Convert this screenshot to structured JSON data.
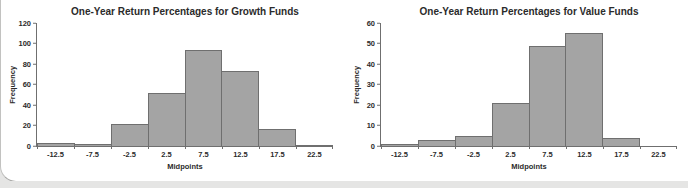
{
  "chart_data": [
    {
      "type": "bar",
      "title": "One-Year Return Percentages for Growth Funds",
      "xlabel": "Midpoints",
      "ylabel": "Frequency",
      "categories": [
        "-12.5",
        "-7.5",
        "-2.5",
        "2.5",
        "7.5",
        "12.5",
        "17.5",
        "22.5"
      ],
      "values": [
        3,
        2,
        21,
        52,
        94,
        73,
        17,
        1
      ],
      "ylim": [
        0,
        120
      ],
      "yticks": [
        0,
        20,
        40,
        60,
        80,
        100,
        120
      ],
      "grid": false,
      "legend": "none",
      "bar_fill": "#a4a4a4",
      "bar_border": "#6f6f6f",
      "axis_color": "#6f6f6f"
    },
    {
      "type": "bar",
      "title": "One-Year Return Percentages for Value Funds",
      "xlabel": "Midpoints",
      "ylabel": "Frequency",
      "categories": [
        "-12.5",
        "-7.5",
        "-2.5",
        "2.5",
        "7.5",
        "12.5",
        "17.5",
        "22.5"
      ],
      "values": [
        1,
        3,
        5,
        21,
        49,
        55,
        4,
        0
      ],
      "ylim": [
        0,
        60
      ],
      "yticks": [
        0,
        10,
        20,
        30,
        40,
        50,
        60
      ],
      "grid": false,
      "legend": "none",
      "bar_fill": "#a4a4a4",
      "bar_border": "#6f6f6f",
      "axis_color": "#6f6f6f"
    }
  ]
}
